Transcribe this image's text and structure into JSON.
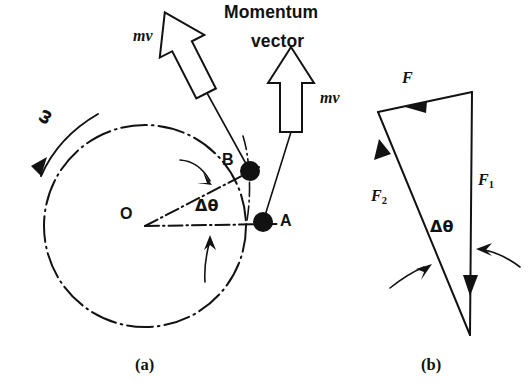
{
  "figure": {
    "title_line1": "Momentum",
    "title_line2": "vector",
    "captions": {
      "left": "(a)",
      "right": "(b)"
    },
    "colors": {
      "ink": "#121212",
      "background": "#ffffff"
    }
  },
  "panel_a": {
    "caption": "(a)",
    "center_label": "O",
    "point_b_label": "B",
    "point_a_label": "A",
    "angle_label": "Δθ",
    "omega_label": "ω",
    "momentum_label_b": "mv",
    "momentum_label_a": "mv",
    "title_line1": "Momentum",
    "title_line2": "vector",
    "geometry": {
      "center_x": 145,
      "center_y": 226,
      "radius": 101,
      "point_a_x": 263,
      "point_a_y": 222,
      "point_b_x": 250,
      "point_b_y": 171,
      "delta_theta_deg": 25
    }
  },
  "panel_b": {
    "caption": "(b)",
    "resultant_label": "F",
    "force1_label": "F",
    "force1_sub": "1",
    "force2_label": "F",
    "force2_sub": "2",
    "angle_label": "Δθ",
    "geometry": {
      "apex_top_right_x": 472,
      "apex_top_right_y": 92,
      "apex_top_left_x": 378,
      "apex_top_left_y": 112,
      "apex_bottom_x": 470,
      "apex_bottom_y": 335
    }
  }
}
